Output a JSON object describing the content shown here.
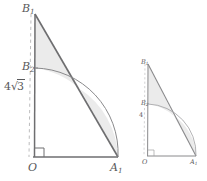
{
  "figure": {
    "background_color": "#ffffff",
    "stroke_color": "#6e6e70",
    "shade_color": "#e9e9e9",
    "dash_color": "#b0b0b2",
    "label_color": "#58585a"
  },
  "large_figure": {
    "name": "large-triangle-figure",
    "labels": {
      "apex": "B",
      "apex_sub": "1",
      "mid": "B",
      "mid_sub": "2",
      "origin": "O",
      "base_end": "A",
      "base_end_sub": "1",
      "length_prefix": "4",
      "length_radicand": "3"
    },
    "points": {
      "O": [
        33,
        157
      ],
      "A1": [
        118,
        157
      ],
      "B1": [
        35,
        14
      ],
      "B2": [
        35,
        68
      ]
    },
    "arc": {
      "from": [
        35,
        68
      ],
      "to": [
        118,
        157
      ],
      "radius": 85,
      "sweep": 1,
      "large_arc": 0
    },
    "right_angle_marker": {
      "size": 9,
      "at": [
        33,
        157
      ]
    },
    "dashed_axis": {
      "from": [
        31,
        14
      ],
      "to": [
        29,
        157
      ]
    }
  },
  "small_figure": {
    "name": "small-triangle-figure",
    "labels": {
      "apex": "B",
      "apex_sub": "1",
      "mid": "B",
      "mid_sub": "2",
      "origin": "O",
      "base_end": "A",
      "base_end_sub": "1",
      "length_prefix": "4",
      "length_radicand": ""
    },
    "points": {
      "O": [
        147,
        156
      ],
      "A1": [
        196,
        156
      ],
      "B1": [
        148,
        64
      ],
      "B2": [
        148,
        104
      ]
    },
    "arc": {
      "from": [
        148,
        104
      ],
      "to": [
        196,
        156
      ],
      "radius": 50,
      "sweep": 1,
      "large_arc": 0
    },
    "right_angle_marker": {
      "size": 6,
      "at": [
        147,
        156
      ]
    },
    "dashed_axis": {
      "from": [
        145,
        64
      ],
      "to": [
        144,
        156
      ]
    }
  }
}
